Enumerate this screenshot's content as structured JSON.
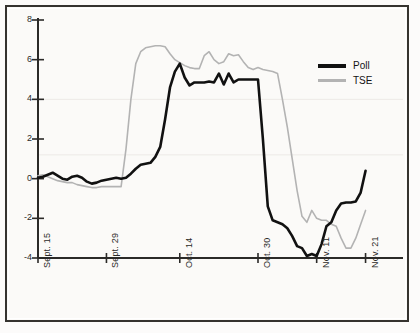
{
  "chart_data": {
    "type": "line",
    "title": "",
    "subtitle": "",
    "xlabel": "",
    "ylabel": "",
    "ylim": [
      -4,
      8
    ],
    "yticks": [
      8,
      6,
      4,
      2,
      0,
      -2,
      -4
    ],
    "ytick_labels": [
      "8",
      "6",
      "4",
      "2",
      "0",
      "-2",
      "-4"
    ],
    "xtick_labels": [
      "Sept. 15",
      "Sept. 29",
      "Oct. 14",
      "Oct. 30",
      "Nov. 11",
      "Nov. 21"
    ],
    "xtick_positions": [
      0,
      14,
      29,
      45,
      57,
      67
    ],
    "xlim": [
      0,
      72
    ],
    "grid": false,
    "legend_position": "top-right",
    "colors": {
      "poll": "#111111",
      "tse": "#b3b3b3",
      "axis": "#2b2a28",
      "background": "#fbfaf8",
      "frame": "#35332f"
    },
    "series": [
      {
        "name": "Poll",
        "color": "#111111",
        "linewidth": 2.6,
        "x": [
          0,
          1,
          2,
          3,
          4,
          5,
          6,
          7,
          8,
          9,
          10,
          11,
          12,
          13,
          14,
          15,
          16,
          17,
          18,
          19,
          20,
          21,
          22,
          23,
          24,
          25,
          26,
          27,
          28,
          29,
          30,
          31,
          32,
          33,
          34,
          35,
          36,
          37,
          38,
          39,
          40,
          41,
          42,
          43,
          44,
          45,
          46,
          47,
          48,
          49,
          50,
          51,
          52,
          53,
          54,
          55,
          56,
          57,
          58,
          59,
          60,
          61,
          62,
          63,
          64,
          65,
          66,
          67
        ],
        "values": [
          0.05,
          0.1,
          0.2,
          0.3,
          0.15,
          0.0,
          -0.05,
          0.1,
          0.15,
          0.05,
          -0.15,
          -0.25,
          -0.2,
          -0.1,
          -0.05,
          0.0,
          0.05,
          0.0,
          0.05,
          0.25,
          0.5,
          0.7,
          0.75,
          0.8,
          1.1,
          1.6,
          3.0,
          4.6,
          5.4,
          5.8,
          5.1,
          4.7,
          4.85,
          4.85,
          4.85,
          4.9,
          4.85,
          5.3,
          4.75,
          5.3,
          4.85,
          5.0,
          5.0,
          5.0,
          5.0,
          5.0,
          2.0,
          -1.4,
          -2.1,
          -2.2,
          -2.3,
          -2.5,
          -2.9,
          -3.4,
          -3.5,
          -3.9,
          -3.8,
          -3.9,
          -3.3,
          -2.4,
          -2.2,
          -1.6,
          -1.25,
          -1.2,
          -1.2,
          -1.15,
          -0.7,
          0.4
        ]
      },
      {
        "name": "TSE",
        "color": "#b3b3b3",
        "linewidth": 1.6,
        "x": [
          0,
          1,
          2,
          3,
          4,
          5,
          6,
          7,
          8,
          9,
          10,
          11,
          12,
          13,
          14,
          15,
          16,
          17,
          18,
          19,
          20,
          21,
          22,
          23,
          24,
          25,
          26,
          27,
          28,
          29,
          30,
          31,
          32,
          33,
          34,
          35,
          36,
          37,
          38,
          39,
          40,
          41,
          42,
          43,
          44,
          45,
          46,
          47,
          48,
          49,
          50,
          51,
          52,
          53,
          54,
          55,
          56,
          57,
          58,
          59,
          60,
          61,
          62,
          63,
          64,
          65,
          66,
          67
        ],
        "values": [
          0.15,
          0.2,
          0.1,
          0.0,
          -0.1,
          -0.15,
          -0.2,
          -0.2,
          -0.3,
          -0.35,
          -0.4,
          -0.45,
          -0.45,
          -0.4,
          -0.4,
          -0.4,
          -0.4,
          -0.4,
          1.5,
          4.0,
          5.8,
          6.4,
          6.6,
          6.65,
          6.7,
          6.7,
          6.65,
          6.3,
          6.0,
          5.85,
          5.7,
          5.6,
          5.55,
          5.55,
          6.2,
          6.4,
          6.0,
          5.8,
          5.9,
          6.3,
          6.2,
          6.25,
          5.9,
          5.6,
          5.5,
          5.6,
          5.5,
          5.45,
          5.4,
          5.3,
          4.0,
          2.6,
          1.0,
          -0.6,
          -1.9,
          -2.2,
          -1.6,
          -2.0,
          -2.1,
          -2.1,
          -2.3,
          -2.4,
          -3.0,
          -3.5,
          -3.5,
          -3.0,
          -2.3,
          -1.6
        ]
      }
    ],
    "legend": [
      {
        "label": "Poll",
        "color": "#111111",
        "style": "thick-solid"
      },
      {
        "label": "TSE",
        "color": "#b3b3b3",
        "style": "thin-solid"
      }
    ]
  }
}
